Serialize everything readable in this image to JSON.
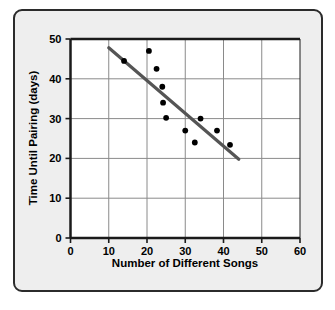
{
  "chart_data": {
    "type": "scatter",
    "title": "",
    "xlabel": "Number of Different Songs",
    "ylabel": "Time Until Pairing (days)",
    "xlim": [
      0,
      60
    ],
    "ylim": [
      0,
      50
    ],
    "xticks": [
      0,
      10,
      20,
      30,
      40,
      50,
      60
    ],
    "yticks": [
      0,
      10,
      20,
      30,
      40,
      50
    ],
    "xtick_labels": [
      "0",
      "10",
      "20",
      "30",
      "40",
      "50",
      "60"
    ],
    "ytick_labels": [
      "0",
      "10",
      "20",
      "30",
      "40",
      "50"
    ],
    "grid": true,
    "legend": false,
    "points": [
      {
        "x": 14,
        "y": 44.5
      },
      {
        "x": 20.5,
        "y": 47
      },
      {
        "x": 22.5,
        "y": 42.5
      },
      {
        "x": 24,
        "y": 38
      },
      {
        "x": 24.2,
        "y": 34
      },
      {
        "x": 25,
        "y": 30.2
      },
      {
        "x": 30,
        "y": 27
      },
      {
        "x": 32.5,
        "y": 24
      },
      {
        "x": 34,
        "y": 30
      },
      {
        "x": 38.3,
        "y": 27
      },
      {
        "x": 41.7,
        "y": 23.4
      }
    ],
    "trend_line": {
      "x1": 10,
      "y1": 47.8,
      "x2": 44,
      "y2": 19.8
    },
    "colors": {
      "point": "#000000",
      "trend_line": "#555555",
      "axis": "#1a1a1a",
      "grid": "#888888",
      "plot_background": "#ffffff",
      "figure_background": "#eeeeee",
      "frame_border": "#2b2b2b"
    }
  }
}
